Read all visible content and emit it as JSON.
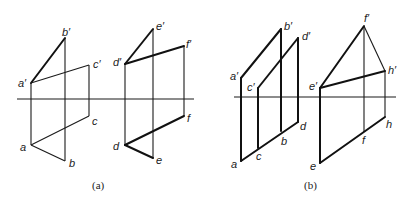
{
  "figure": {
    "panels": [
      {
        "caption": "(a)",
        "labels": {
          "a_p": "a′",
          "b_p": "b′",
          "c_p": "c′",
          "a": "a",
          "b": "b",
          "c": "c",
          "d_p": "d′",
          "e_p": "e′",
          "f_p": "f′",
          "d": "d",
          "e": "e",
          "f": "f"
        }
      },
      {
        "caption": "(b)",
        "labels": {
          "a_p": "a′",
          "b_p": "b′",
          "c_p": "c′",
          "d_p": "d′",
          "a": "a",
          "b": "b",
          "c": "c",
          "d": "d",
          "e_p": "e′",
          "f_p": "f′",
          "h_p": "h′",
          "e": "e",
          "f": "f",
          "h": "h"
        }
      }
    ]
  }
}
